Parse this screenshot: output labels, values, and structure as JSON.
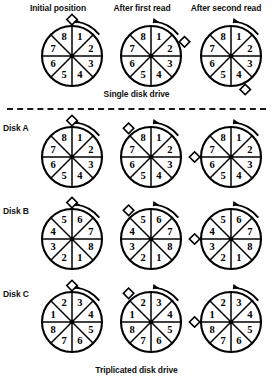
{
  "figure": {
    "title_captions": {
      "single": "Single disk drive",
      "triplicated": "Triplicated disk drive"
    },
    "column_headers": [
      "Initial position",
      "After first read",
      "After second read"
    ],
    "row_labels": {
      "disk_a": "Disk A",
      "disk_b": "Disk B",
      "disk_c": "Disk C"
    },
    "colors": {
      "ink": "#000000",
      "background": "#ffffff"
    },
    "disks": {
      "single": {
        "sectors": [
          "8",
          "1",
          "2",
          "3",
          "4",
          "5",
          "6",
          "7"
        ],
        "states": [
          {
            "marker_angle_deg": 0,
            "marker_label": "diamond"
          },
          {
            "marker_angle_deg": 67,
            "marker_label": "diamond"
          },
          {
            "marker_angle_deg": 157,
            "marker_label": "diamond"
          }
        ]
      },
      "disk_a": {
        "sectors": [
          "8",
          "1",
          "2",
          "3",
          "4",
          "5",
          "6",
          "7"
        ],
        "states": [
          {
            "marker_angle_deg": 0,
            "marker_label": "diamond"
          },
          {
            "marker_angle_deg": -38,
            "marker_label": "diamond"
          },
          {
            "marker_angle_deg": -90,
            "marker_label": "diamond"
          }
        ]
      },
      "disk_b": {
        "sectors": [
          "5",
          "6",
          "7",
          "8",
          "1",
          "2",
          "3",
          "4"
        ],
        "states": [
          {
            "marker_angle_deg": 0,
            "marker_label": "diamond"
          },
          {
            "marker_angle_deg": -38,
            "marker_label": "diamond"
          },
          {
            "marker_angle_deg": -90,
            "marker_label": "diamond"
          }
        ]
      },
      "disk_c": {
        "sectors": [
          "2",
          "3",
          "4",
          "5",
          "6",
          "7",
          "8",
          "1"
        ],
        "states": [
          {
            "marker_angle_deg": 0,
            "marker_label": "diamond"
          },
          {
            "marker_angle_deg": -38,
            "marker_label": "diamond"
          },
          {
            "marker_angle_deg": -90,
            "marker_label": "diamond"
          }
        ]
      }
    },
    "rotation_arrow": {
      "label": "clockwise-rotation-arrow",
      "direction": "clockwise"
    }
  }
}
